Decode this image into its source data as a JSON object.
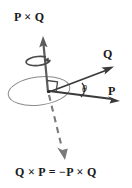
{
  "figure": {
    "title_label": "P × Q",
    "equation_label": "Q × P = −P × Q",
    "vector_q_label": "Q",
    "vector_p_label": "P",
    "angle_label": "θ",
    "colors": {
      "background": "#ffffff",
      "ink": "#1a1a1a",
      "stroke_dark": "#3a3a3a",
      "stroke_mid": "#5c5c5c",
      "stroke_light": "#8a8a8a"
    },
    "elements": {
      "plane_ellipse": "plane-ellipse",
      "up_arrow": "cross-product-up-arrow",
      "down_dashed_arrow": "cross-product-down-dashed-arrow",
      "rotation_curl": "right-hand-rotation-curl",
      "right_angle_marker": "right-angle-marker",
      "angle_arc": "angle-arc",
      "origin": "origin-point"
    }
  }
}
